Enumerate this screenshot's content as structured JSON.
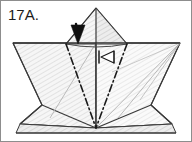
{
  "figure": {
    "step_label": "17A.",
    "caption": "",
    "diagram_type": "origami-fold-step",
    "canvas": {
      "width": 192,
      "height": 142
    },
    "background_color": "#ffffff",
    "border_color": "#8d8d8d",
    "colors": {
      "outline_dark": "#2e2e2e",
      "outline_mid": "#555555",
      "outline_light": "#9a9a9a",
      "paper_fill": "#f4f4f4",
      "paper_fill_shade": "#ececec",
      "hatch_line": "#c9c9c9",
      "crease_chain": "#1a1a1a",
      "arrow_solid_fill": "#101010",
      "arrow_hollow_fill": "#ffffff",
      "arrow_hollow_stroke": "#1a1a1a"
    },
    "annotations": [
      {
        "name": "solid-fold-arrow",
        "kind": "solid-arrow",
        "direction": "down",
        "meaning": "fold-down",
        "x": 78,
        "y": 40
      },
      {
        "name": "hollow-pullout-arrow",
        "kind": "hollow-arrow",
        "direction": "left",
        "meaning": "pull-out",
        "x": 104,
        "y": 57
      }
    ],
    "crease_lines": [
      {
        "name": "mountain-crease-left",
        "style": "dash-dot",
        "from": [
          66,
          44
        ],
        "to": [
          96,
          128
        ]
      },
      {
        "name": "mountain-crease-right",
        "style": "dash-dot",
        "from": [
          127,
          44
        ],
        "to": [
          96,
          128
        ]
      }
    ],
    "key_points": {
      "top_apex": [
        96,
        8
      ],
      "bottom_apex": [
        96,
        128
      ],
      "left_brim": [
        13,
        43
      ],
      "right_brim": [
        180,
        43
      ],
      "left_wing_tip": [
        20,
        124
      ],
      "right_wing_tip": [
        172,
        124
      ],
      "left_knee": [
        42,
        105
      ],
      "right_knee": [
        151,
        105
      ]
    }
  }
}
